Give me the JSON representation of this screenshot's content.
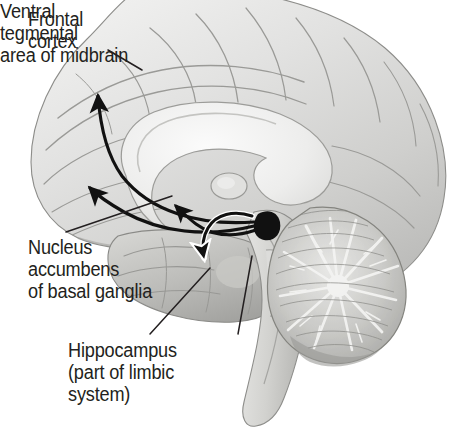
{
  "figure": {
    "name": "brain-sagittal-reward-pathway",
    "background_color": "#ffffff",
    "text_color": "#231f20",
    "arrow_color": "#000000"
  },
  "labels": {
    "frontal_cortex": "Frontal\ncortex",
    "nucleus_accumbens": "Nucleus\naccumbens\nof basal ganglia",
    "hippocampus": "Hippocampus\n(part of limbic\nsystem)",
    "ventral_tegmental_area": "Ventral\ntegmental\narea of midbrain"
  },
  "anatomy": {
    "structures": [
      "cerebral cortex",
      "corpus callosum",
      "thalamus",
      "cerebellum",
      "brainstem",
      "ventral tegmental area",
      "nucleus accumbens",
      "hippocampus"
    ]
  },
  "pathway_arrows": [
    {
      "name": "vta-to-frontal-cortex-upper",
      "from": "ventral tegmental area",
      "to": "frontal cortex",
      "style": "curved-solid-black"
    },
    {
      "name": "vta-to-frontal-cortex-lower",
      "from": "ventral tegmental area",
      "to": "frontal cortex",
      "style": "curved-solid-black"
    },
    {
      "name": "vta-to-nucleus-accumbens",
      "from": "ventral tegmental area",
      "to": "nucleus accumbens",
      "style": "curved-solid-black"
    },
    {
      "name": "vta-to-hippocampus",
      "from": "ventral tegmental area",
      "to": "hippocampus",
      "style": "curved-solid-black-white-outline"
    }
  ],
  "leader_lines": [
    {
      "name": "leader-frontal-cortex",
      "label": "frontal_cortex"
    },
    {
      "name": "leader-nucleus-accumbens",
      "label": "nucleus_accumbens"
    },
    {
      "name": "leader-hippocampus",
      "label": "hippocampus"
    },
    {
      "name": "leader-ventral-tegmental-area",
      "label": "ventral_tegmental_area"
    }
  ]
}
